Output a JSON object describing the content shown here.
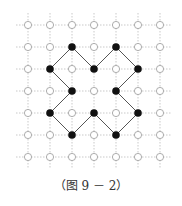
{
  "diagram": {
    "grid": {
      "cols": 7,
      "rows": 7,
      "origin_x": 28,
      "origin_y": 25,
      "spacing": 22
    },
    "filled_points": [
      [
        2,
        1
      ],
      [
        4,
        1
      ],
      [
        1,
        2
      ],
      [
        3,
        2
      ],
      [
        5,
        2
      ],
      [
        2,
        3
      ],
      [
        4,
        3
      ],
      [
        1,
        4
      ],
      [
        3,
        4
      ],
      [
        5,
        4
      ],
      [
        2,
        5
      ],
      [
        4,
        5
      ]
    ],
    "edges": [
      [
        [
          2,
          1
        ],
        [
          1,
          2
        ]
      ],
      [
        [
          2,
          1
        ],
        [
          3,
          2
        ]
      ],
      [
        [
          3,
          2
        ],
        [
          4,
          1
        ]
      ],
      [
        [
          4,
          1
        ],
        [
          5,
          2
        ]
      ],
      [
        [
          1,
          2
        ],
        [
          2,
          3
        ]
      ],
      [
        [
          5,
          2
        ],
        [
          4,
          3
        ]
      ],
      [
        [
          2,
          3
        ],
        [
          1,
          4
        ]
      ],
      [
        [
          4,
          3
        ],
        [
          5,
          4
        ]
      ],
      [
        [
          1,
          4
        ],
        [
          2,
          5
        ]
      ],
      [
        [
          2,
          5
        ],
        [
          3,
          4
        ]
      ],
      [
        [
          3,
          4
        ],
        [
          4,
          5
        ]
      ],
      [
        [
          4,
          5
        ],
        [
          5,
          4
        ]
      ]
    ],
    "colors": {
      "grid": "#bbbbbb",
      "open_circle": "#999999",
      "filled": "#111111",
      "edge": "#555555"
    }
  },
  "caption": "（图 9 － 2）"
}
